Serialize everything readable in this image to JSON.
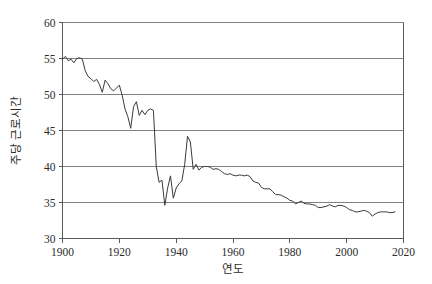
{
  "chart_data": {
    "type": "line",
    "title": "",
    "xlabel": "연도",
    "ylabel": "주당 근로시간",
    "xlim": [
      1900,
      2020
    ],
    "ylim": [
      30,
      60
    ],
    "xticks": [
      1900,
      1920,
      1940,
      1960,
      1980,
      2000,
      2020
    ],
    "yticks": [
      30,
      35,
      40,
      45,
      50,
      55,
      60
    ],
    "xtick_labels": [
      "1900",
      "1920",
      "1940",
      "1960",
      "1980",
      "2000",
      "2020"
    ],
    "ytick_labels": [
      "30",
      "35",
      "40",
      "45",
      "50",
      "55",
      "60"
    ],
    "grid": "horizontal",
    "legend": "none",
    "series_color": "#3a3a3a",
    "grid_color": "#808080",
    "axis_color": "#5a5a5a",
    "series": [
      {
        "name": "주당 근로시간",
        "x": [
          1900,
          1901,
          1902,
          1903,
          1904,
          1905,
          1906,
          1907,
          1908,
          1909,
          1910,
          1911,
          1912,
          1913,
          1914,
          1915,
          1916,
          1917,
          1918,
          1919,
          1920,
          1921,
          1922,
          1923,
          1924,
          1925,
          1926,
          1927,
          1928,
          1929,
          1930,
          1931,
          1932,
          1933,
          1934,
          1935,
          1936,
          1937,
          1938,
          1939,
          1940,
          1941,
          1942,
          1943,
          1944,
          1945,
          1946,
          1947,
          1948,
          1949,
          1950,
          1951,
          1952,
          1953,
          1954,
          1955,
          1956,
          1957,
          1958,
          1959,
          1960,
          1961,
          1962,
          1963,
          1964,
          1965,
          1966,
          1967,
          1968,
          1969,
          1970,
          1971,
          1972,
          1973,
          1974,
          1975,
          1976,
          1977,
          1978,
          1979,
          1980,
          1981,
          1982,
          1983,
          1984,
          1985,
          1986,
          1987,
          1988,
          1989,
          1990,
          1991,
          1992,
          1993,
          1994,
          1995,
          1996,
          1997,
          1998,
          1999,
          2000,
          2001,
          2002,
          2003,
          2004,
          2005,
          2006,
          2007,
          2008,
          2009,
          2010,
          2011,
          2012,
          2013,
          2014,
          2015,
          2016,
          2017
        ],
        "values": [
          54.9,
          55.3,
          54.7,
          54.9,
          54.4,
          55.0,
          55.1,
          54.9,
          53.3,
          52.5,
          52.2,
          51.8,
          52.1,
          51.4,
          50.3,
          52.0,
          51.5,
          50.8,
          50.5,
          50.9,
          51.3,
          49.9,
          48.0,
          46.9,
          45.3,
          48.3,
          49.0,
          47.1,
          47.8,
          47.2,
          47.8,
          48.0,
          47.8,
          40.0,
          37.8,
          38.1,
          34.6,
          37.0,
          38.7,
          35.6,
          37.0,
          37.6,
          38.0,
          40.3,
          44.2,
          43.4,
          39.6,
          40.3,
          39.5,
          39.9,
          40.0,
          40.0,
          39.9,
          39.6,
          39.7,
          39.6,
          39.3,
          39.0,
          38.9,
          39.0,
          38.8,
          38.7,
          38.8,
          38.8,
          38.7,
          38.8,
          38.6,
          38.0,
          37.8,
          37.7,
          37.1,
          36.9,
          36.9,
          36.9,
          36.5,
          36.1,
          36.1,
          36.0,
          35.8,
          35.6,
          35.3,
          35.2,
          34.8,
          35.0,
          35.2,
          34.9,
          34.8,
          34.8,
          34.7,
          34.6,
          34.3,
          34.3,
          34.4,
          34.5,
          34.7,
          34.5,
          34.4,
          34.6,
          34.6,
          34.5,
          34.3,
          34.0,
          33.9,
          33.7,
          33.7,
          33.8,
          33.9,
          33.8,
          33.6,
          33.1,
          33.4,
          33.6,
          33.7,
          33.7,
          33.7,
          33.6,
          33.6,
          33.7
        ]
      }
    ]
  }
}
